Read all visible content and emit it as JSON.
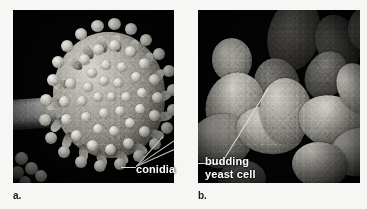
{
  "figure": {
    "background_color": "#f6f6f4",
    "panels": [
      {
        "id": "a",
        "letter": "a.",
        "subject": "sem-micrograph-aspergillus-conidiophore",
        "background_color": "#000000",
        "callout": {
          "label": "conidia",
          "color": "#ffffff",
          "leader_lines": 3
        }
      },
      {
        "id": "b",
        "letter": "b.",
        "subject": "sem-micrograph-budding-yeast-cells",
        "background_color": "#000000",
        "callout": {
          "label": "budding\nyeast cell",
          "color": "#ffffff",
          "leader_lines": 1
        }
      }
    ]
  }
}
